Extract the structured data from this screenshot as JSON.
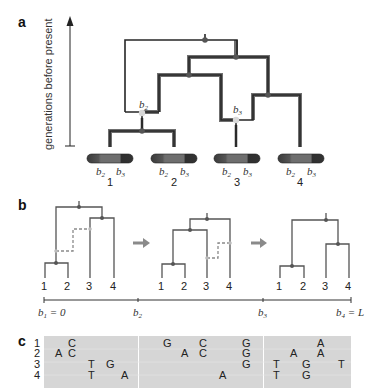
{
  "panels": {
    "a": {
      "label": "a",
      "axis_label": "generations before present",
      "breakpoints": {
        "b2": "b",
        "b2_sub": "2",
        "b3": "b",
        "b3_sub": "3"
      },
      "chromosomes": [
        {
          "id": "1",
          "b2": "b",
          "b2_sub": "2",
          "b3": "b",
          "b3_sub": "3"
        },
        {
          "id": "2",
          "b2": "b",
          "b2_sub": "2",
          "b3": "b",
          "b3_sub": "3"
        },
        {
          "id": "3",
          "b2": "b",
          "b2_sub": "2",
          "b3": "b",
          "b3_sub": "3"
        },
        {
          "id": "4",
          "b2": "b",
          "b2_sub": "2",
          "b3": "b",
          "b3_sub": "3"
        }
      ]
    },
    "b": {
      "label": "b",
      "trees": [
        {
          "leaves": [
            "1",
            "2",
            "3",
            "4"
          ]
        },
        {
          "leaves": [
            "1",
            "2",
            "3",
            "4"
          ]
        },
        {
          "leaves": [
            "1",
            "2",
            "3",
            "4"
          ]
        }
      ],
      "arrows": [
        "→",
        "→"
      ],
      "axis": [
        {
          "label": "b",
          "sub": "1",
          "suffix": " = 0"
        },
        {
          "label": "b",
          "sub": "2",
          "suffix": ""
        },
        {
          "label": "b",
          "sub": "3",
          "suffix": ""
        },
        {
          "label": "b",
          "sub": "4",
          "suffix": " = L"
        }
      ]
    },
    "c": {
      "label": "c",
      "row_labels": [
        "1",
        "2",
        "3",
        "4"
      ],
      "blocks": [
        {
          "rows": [
            [
              {
                "x": 68,
                "b": "C"
              }
            ],
            [
              {
                "x": 55,
                "b": "A"
              },
              {
                "x": 68,
                "b": "C"
              }
            ],
            [
              {
                "x": 88,
                "b": "T"
              },
              {
                "x": 106,
                "b": "G"
              }
            ],
            [
              {
                "x": 88,
                "b": "T"
              },
              {
                "x": 121,
                "b": "A"
              }
            ]
          ]
        },
        {
          "rows": [
            [
              {
                "x": 163,
                "b": "G"
              },
              {
                "x": 199,
                "b": "C"
              },
              {
                "x": 242,
                "b": "G"
              }
            ],
            [
              {
                "x": 181,
                "b": "A"
              },
              {
                "x": 199,
                "b": "C"
              },
              {
                "x": 242,
                "b": "G"
              }
            ],
            [
              {
                "x": 242,
                "b": "G"
              }
            ],
            [
              {
                "x": 219,
                "b": "A"
              }
            ]
          ]
        },
        {
          "rows": [
            [
              {
                "x": 317,
                "b": "A"
              }
            ],
            [
              {
                "x": 290,
                "b": "A"
              },
              {
                "x": 317,
                "b": "A"
              }
            ],
            [
              {
                "x": 273,
                "b": "T"
              },
              {
                "x": 302,
                "b": "G"
              },
              {
                "x": 338,
                "b": "T"
              }
            ],
            [
              {
                "x": 273,
                "b": "T"
              },
              {
                "x": 302,
                "b": "G"
              }
            ]
          ]
        }
      ]
    }
  },
  "colors": {
    "branch_dark": "#2e2e2e",
    "branch_grey": "#6a6a6a",
    "node": "#555555",
    "breakpoint_node": "#d8d8d8",
    "dashed": "#9a9a9a",
    "alignment_bg": "#d6d6d6",
    "arrow": "#8a8a8a"
  }
}
